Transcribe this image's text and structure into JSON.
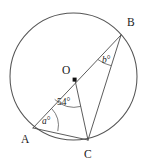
{
  "figure": {
    "type": "circle-geometry-diagram",
    "background_color": "#ffffff",
    "stroke_color": "#4a4a4a",
    "text_color": "#1a1a1a",
    "circle": {
      "center_label": "O",
      "center_x": 73.5,
      "center_y": 76.5,
      "radius": 64
    },
    "points": [
      {
        "label": "A",
        "x": 33,
        "y": 128,
        "label_x": 21,
        "label_y": 143
      },
      {
        "label": "B",
        "x": 121,
        "y": 35,
        "label_x": 127,
        "label_y": 26
      },
      {
        "label": "C",
        "x": 88,
        "y": 140,
        "label_x": 84,
        "label_y": 158
      },
      {
        "label": "O",
        "x": 75,
        "y": 80,
        "label_x": 62,
        "label_y": 74
      }
    ],
    "segments": [
      {
        "name": "segment-A-B",
        "from": "A",
        "to": "B"
      },
      {
        "name": "segment-A-C",
        "from": "A",
        "to": "C"
      },
      {
        "name": "segment-B-C",
        "from": "B",
        "to": "C"
      },
      {
        "name": "segment-O-C",
        "from": "O",
        "to": "C"
      }
    ],
    "angles": [
      {
        "name": "angle-at-A",
        "vertex": "A",
        "label": "a",
        "unit": "°",
        "label_x": 43,
        "label_y": 124
      },
      {
        "name": "angle-at-B",
        "vertex": "B",
        "label": "b",
        "unit": "°",
        "label_x": 103,
        "label_y": 62
      },
      {
        "name": "angle-at-O",
        "vertex": "O",
        "label": "54",
        "unit": "°",
        "label_x": 59,
        "label_y": 104
      }
    ]
  }
}
